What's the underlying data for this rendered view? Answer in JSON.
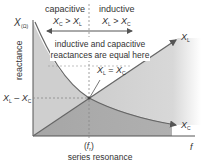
{
  "diagram": {
    "y_axis": {
      "symbol": "X",
      "unit": "(Ω)",
      "label": "reactance"
    },
    "x_axis": {
      "label": "f"
    },
    "regions": {
      "capacitive": {
        "label": "capacitive",
        "relation_main": "X",
        "relation_sub1": "C",
        "relation_op": " > ",
        "relation_main2": "X",
        "relation_sub2": "L"
      },
      "inductive": {
        "label": "inductive",
        "relation_main": "X",
        "relation_sub1": "L",
        "relation_op": " > ",
        "relation_main2": "X",
        "relation_sub2": "C"
      }
    },
    "annotation_line1": "inductive and capacitive",
    "annotation_line2": "reactances are equal here",
    "equality": {
      "a": "X",
      "a_sub": "L",
      "op": " = ",
      "b": "X",
      "b_sub": "C"
    },
    "curve_labels": {
      "inductive": "X",
      "inductive_sub": "L",
      "capacitive": "X",
      "capacitive_sub": "C"
    },
    "level_label": {
      "a": "X",
      "a_sub": "L",
      "op": " – ",
      "b": "X",
      "b_sub": "C"
    },
    "resonance_tick": {
      "open": "(",
      "f": "f",
      "sub": "r",
      "close": ")"
    },
    "resonance_label": "series resonance",
    "colors": {
      "light_fill": "#cfcfcf",
      "dark_fill": "#a9a9a9",
      "line": "#555555",
      "dashed": "#777777"
    }
  }
}
